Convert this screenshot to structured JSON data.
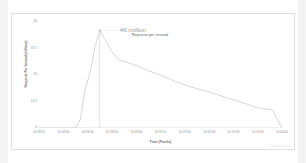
{
  "chart_data": {
    "type": "line",
    "title": "",
    "xlabel": "Time (Pacific)",
    "ylabel": "Requests Per Second (millions)",
    "ylim": [
      0,
      50
    ],
    "yticks": [
      "50",
      "37.5",
      "25",
      "12.5",
      "0"
    ],
    "ytick_values": [
      50,
      37.5,
      25,
      12.5,
      0
    ],
    "grid": false,
    "legend_position": "none",
    "xticks": [
      "10:18:20",
      "10:18:30",
      "10:18:40",
      "10:18:50",
      "10:19:00",
      "10:19:10",
      "10:19:20",
      "10:19:30",
      "10:19:40",
      "10:19:50",
      "10:20:00"
    ],
    "annotations": [
      {
        "value_label": "46 million",
        "sub_label": "Requests per second",
        "x": "10:18:45",
        "y": 46
      }
    ],
    "series": [
      {
        "name": "Requests per second",
        "color": "#cccccc",
        "x": [
          "10:18:20",
          "10:18:30",
          "10:18:35",
          "10:18:37",
          "10:18:39",
          "10:18:41",
          "10:18:43",
          "10:18:45",
          "10:18:47",
          "10:18:50",
          "10:18:53",
          "10:18:56",
          "10:19:00",
          "10:19:05",
          "10:19:10",
          "10:19:16",
          "10:19:22",
          "10:19:30",
          "10:19:38",
          "10:19:45",
          "10:19:50",
          "10:19:54",
          "10:19:56",
          "10:20:00"
        ],
        "values": [
          0,
          0,
          0,
          4,
          18,
          26,
          38,
          46,
          42,
          36,
          32,
          31,
          29.5,
          27,
          25,
          22,
          19.5,
          17,
          14,
          11.5,
          9.5,
          8.8,
          8.6,
          0
        ]
      }
    ]
  },
  "chart": {
    "annotation_value": "46 million",
    "annotation_sub": "Requests per second",
    "x_axis_title": "Time (Pacific)",
    "y_axis_title": "Requests Per Second (millions)",
    "watermark": "Google Cloud",
    "line_color": "#cccccc",
    "axis_color": "#cfcfcf",
    "text_color": "#8a8a8a",
    "card_border_color": "#dedede"
  }
}
